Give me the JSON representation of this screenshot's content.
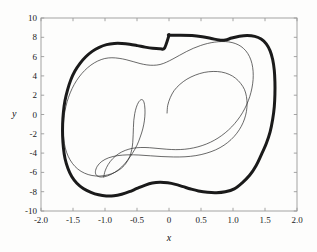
{
  "figure": {
    "background_color": "#fdfdfc",
    "frame_color": "#9a9a9a",
    "curve_color": "#1a1a1a"
  },
  "chart_data": {
    "type": "line",
    "title": "",
    "subtitle": "",
    "xlabel": "x",
    "ylabel": "y",
    "xlim": [
      -2.0,
      2.0
    ],
    "ylim": [
      -10,
      10
    ],
    "grid": false,
    "legend": null,
    "xticks": [
      -2.0,
      -1.5,
      -1.0,
      -0.5,
      0,
      0.5,
      1.0,
      1.5,
      2.0
    ],
    "xtick_labels": [
      "-2.0",
      "-1.5",
      "-1.0",
      "-0.5",
      "0",
      "0.5",
      "1.0",
      "1.5",
      "2.0"
    ],
    "yticks": [
      10,
      8,
      6,
      4,
      2,
      0,
      -2,
      -4,
      -6,
      -8,
      -10
    ],
    "ytick_labels": [
      "10",
      "8",
      "6",
      "4",
      "2",
      "0",
      "-2",
      "-4",
      "-6",
      "-8",
      "-10"
    ],
    "series": [
      {
        "name": "limit-cycle",
        "style": "thick-closed-curve",
        "linewidth": 3.0,
        "color": "#1a1a1a",
        "closed": true,
        "points": [
          [
            0.0,
            8.2
          ],
          [
            0.18,
            8.22
          ],
          [
            0.36,
            8.18
          ],
          [
            0.52,
            8.05
          ],
          [
            0.66,
            7.88
          ],
          [
            0.78,
            7.72
          ],
          [
            0.88,
            7.72
          ],
          [
            0.98,
            7.92
          ],
          [
            1.1,
            8.1
          ],
          [
            1.22,
            8.18
          ],
          [
            1.34,
            8.1
          ],
          [
            1.44,
            7.82
          ],
          [
            1.52,
            7.32
          ],
          [
            1.58,
            6.6
          ],
          [
            1.62,
            5.7
          ],
          [
            1.645,
            4.6
          ],
          [
            1.655,
            3.4
          ],
          [
            1.655,
            2.1
          ],
          [
            1.645,
            0.8
          ],
          [
            1.62,
            -0.5
          ],
          [
            1.58,
            -1.8
          ],
          [
            1.52,
            -3.0
          ],
          [
            1.44,
            -4.2
          ],
          [
            1.36,
            -5.3
          ],
          [
            1.26,
            -6.3
          ],
          [
            1.14,
            -7.1
          ],
          [
            1.02,
            -7.7
          ],
          [
            0.88,
            -8.0
          ],
          [
            0.74,
            -8.1
          ],
          [
            0.6,
            -8.06
          ],
          [
            0.46,
            -7.92
          ],
          [
            0.34,
            -7.72
          ],
          [
            0.22,
            -7.48
          ],
          [
            0.1,
            -7.24
          ],
          [
            -0.02,
            -7.08
          ],
          [
            -0.14,
            -7.02
          ],
          [
            -0.26,
            -7.1
          ],
          [
            -0.38,
            -7.34
          ],
          [
            -0.5,
            -7.66
          ],
          [
            -0.62,
            -8.0
          ],
          [
            -0.74,
            -8.26
          ],
          [
            -0.86,
            -8.42
          ],
          [
            -0.98,
            -8.44
          ],
          [
            -1.1,
            -8.32
          ],
          [
            -1.22,
            -8.06
          ],
          [
            -1.34,
            -7.66
          ],
          [
            -1.44,
            -7.12
          ],
          [
            -1.52,
            -6.42
          ],
          [
            -1.58,
            -5.56
          ],
          [
            -1.625,
            -4.56
          ],
          [
            -1.65,
            -3.44
          ],
          [
            -1.662,
            -2.24
          ],
          [
            -1.662,
            -1.0
          ],
          [
            -1.65,
            0.24
          ],
          [
            -1.625,
            1.44
          ],
          [
            -1.585,
            2.56
          ],
          [
            -1.535,
            3.58
          ],
          [
            -1.47,
            4.5
          ],
          [
            -1.39,
            5.3
          ],
          [
            -1.3,
            5.98
          ],
          [
            -1.2,
            6.54
          ],
          [
            -1.09,
            6.96
          ],
          [
            -0.975,
            7.24
          ],
          [
            -0.855,
            7.36
          ],
          [
            -0.735,
            7.36
          ],
          [
            -0.615,
            7.28
          ],
          [
            -0.495,
            7.14
          ],
          [
            -0.375,
            6.98
          ],
          [
            -0.255,
            6.86
          ],
          [
            -0.14,
            6.82
          ],
          [
            -0.07,
            6.88
          ],
          [
            0.0,
            8.2
          ]
        ]
      },
      {
        "name": "transient-trajectory",
        "style": "thin-spiral",
        "linewidth": 0.7,
        "color": "#2a2a2a",
        "closed": false,
        "start_point": [
          -0.03,
          0.15
        ],
        "points": [
          [
            -0.03,
            0.15
          ],
          [
            -0.02,
            0.95
          ],
          [
            0.02,
            1.75
          ],
          [
            0.08,
            2.48
          ],
          [
            0.17,
            3.12
          ],
          [
            0.28,
            3.66
          ],
          [
            0.41,
            4.08
          ],
          [
            0.55,
            4.36
          ],
          [
            0.69,
            4.46
          ],
          [
            0.82,
            4.4
          ],
          [
            0.94,
            4.16
          ],
          [
            1.04,
            3.76
          ],
          [
            1.12,
            3.22
          ],
          [
            1.18,
            2.58
          ],
          [
            1.21,
            1.86
          ],
          [
            1.22,
            1.1
          ],
          [
            1.21,
            0.32
          ],
          [
            1.18,
            -0.46
          ],
          [
            1.13,
            -1.22
          ],
          [
            1.06,
            -1.94
          ],
          [
            0.97,
            -2.6
          ],
          [
            0.86,
            -3.18
          ],
          [
            0.73,
            -3.66
          ],
          [
            0.58,
            -4.02
          ],
          [
            0.42,
            -4.26
          ],
          [
            0.25,
            -4.38
          ],
          [
            0.07,
            -4.4
          ],
          [
            -0.11,
            -4.36
          ],
          [
            -0.29,
            -4.28
          ],
          [
            -0.47,
            -4.2
          ],
          [
            -0.64,
            -4.18
          ],
          [
            -0.8,
            -4.26
          ],
          [
            -0.94,
            -4.48
          ],
          [
            -1.05,
            -4.86
          ],
          [
            -1.12,
            -5.36
          ],
          [
            -1.15,
            -5.92
          ],
          [
            -1.13,
            -6.32
          ],
          [
            -1.06,
            -6.48
          ],
          [
            -0.96,
            -6.36
          ],
          [
            -0.85,
            -6.0
          ],
          [
            -0.74,
            -5.44
          ],
          [
            -0.65,
            -4.76
          ],
          [
            -0.57,
            -4.0
          ],
          [
            -0.5,
            -3.18
          ],
          [
            -0.45,
            -2.34
          ],
          [
            -0.41,
            -1.5
          ],
          [
            -0.385,
            -0.66
          ],
          [
            -0.375,
            0.16
          ],
          [
            -0.38,
            0.9
          ],
          [
            -0.4,
            1.42
          ],
          [
            -0.435,
            1.54
          ],
          [
            -0.475,
            1.28
          ],
          [
            -0.51,
            0.76
          ],
          [
            -0.535,
            0.1
          ],
          [
            -0.55,
            -0.6
          ],
          [
            -0.556,
            -1.34
          ],
          [
            -0.56,
            -2.1
          ],
          [
            -0.566,
            -2.88
          ],
          [
            -0.582,
            -3.64
          ],
          [
            -0.614,
            -4.36
          ],
          [
            -0.666,
            -5.0
          ],
          [
            -0.742,
            -5.56
          ],
          [
            -0.84,
            -5.98
          ],
          [
            -0.956,
            -6.26
          ],
          [
            -1.08,
            -6.38
          ],
          [
            -1.204,
            -6.32
          ],
          [
            -1.32,
            -6.08
          ],
          [
            -1.424,
            -5.66
          ],
          [
            -1.51,
            -5.06
          ],
          [
            -1.576,
            -4.32
          ],
          [
            -1.62,
            -3.48
          ],
          [
            -1.644,
            -2.56
          ],
          [
            -1.652,
            -1.6
          ],
          [
            -1.646,
            -0.62
          ],
          [
            -1.626,
            0.36
          ],
          [
            -1.592,
            1.32
          ],
          [
            -1.544,
            2.24
          ],
          [
            -1.482,
            3.1
          ],
          [
            -1.406,
            3.88
          ],
          [
            -1.318,
            4.56
          ],
          [
            -1.22,
            5.12
          ],
          [
            -1.114,
            5.54
          ],
          [
            -1.004,
            5.8
          ],
          [
            -0.892,
            5.88
          ],
          [
            -0.78,
            5.82
          ],
          [
            -0.67,
            5.68
          ],
          [
            -0.56,
            5.48
          ],
          [
            -0.452,
            5.28
          ],
          [
            -0.346,
            5.14
          ],
          [
            -0.242,
            5.1
          ],
          [
            -0.14,
            5.18
          ],
          [
            -0.04,
            5.42
          ],
          [
            0.062,
            5.76
          ],
          [
            0.166,
            6.14
          ],
          [
            0.272,
            6.52
          ],
          [
            0.38,
            6.86
          ],
          [
            0.49,
            7.14
          ],
          [
            0.602,
            7.36
          ],
          [
            0.714,
            7.5
          ],
          [
            0.826,
            7.56
          ],
          [
            0.934,
            7.52
          ],
          [
            1.034,
            7.36
          ],
          [
            1.124,
            7.06
          ],
          [
            1.2,
            6.6
          ],
          [
            1.258,
            6.0
          ],
          [
            1.296,
            5.28
          ],
          [
            1.314,
            4.48
          ],
          [
            1.314,
            3.62
          ],
          [
            1.296,
            2.74
          ],
          [
            1.262,
            1.86
          ],
          [
            1.212,
            1.0
          ],
          [
            1.148,
            0.18
          ],
          [
            1.07,
            -0.58
          ],
          [
            0.98,
            -1.28
          ],
          [
            0.878,
            -1.9
          ],
          [
            0.766,
            -2.44
          ],
          [
            0.646,
            -2.88
          ],
          [
            0.518,
            -3.22
          ],
          [
            0.384,
            -3.46
          ],
          [
            0.246,
            -3.6
          ],
          [
            0.106,
            -3.64
          ],
          [
            -0.034,
            -3.6
          ],
          [
            -0.172,
            -3.52
          ],
          [
            -0.308,
            -3.44
          ],
          [
            -0.44,
            -3.42
          ],
          [
            -0.566,
            -3.5
          ],
          [
            -0.684,
            -3.72
          ],
          [
            -0.79,
            -4.08
          ],
          [
            -0.88,
            -4.58
          ],
          [
            -0.95,
            -5.18
          ],
          [
            -0.998,
            -5.84
          ],
          [
            -1.02,
            -6.48
          ]
        ]
      }
    ],
    "annotations": []
  }
}
